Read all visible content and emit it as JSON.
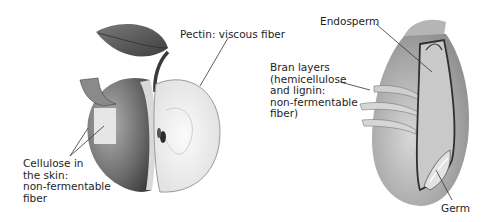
{
  "figure": {
    "left_panel": {
      "subject": "apple",
      "labels": {
        "pectin": "Pectin: viscous fiber",
        "cellulose": "Cellulose in\nthe skin:\nnon-fermentable\nfiber"
      }
    },
    "right_panel": {
      "subject": "grain kernel",
      "labels": {
        "endosperm": "Endosperm",
        "bran": "Bran layers\n(hemicellulose\nand lignin:\nnon-fermentable\nfiber)",
        "germ": "Germ"
      }
    },
    "colors": {
      "skin_dark": "#4a4a4a",
      "skin_mid": "#8a8a8a",
      "flesh": "#f1f1f1",
      "leaf": "#5a5a5a",
      "grain_body": "#bdbdbd",
      "grain_dark": "#3a3a3a",
      "leader_line": "#333333"
    }
  }
}
